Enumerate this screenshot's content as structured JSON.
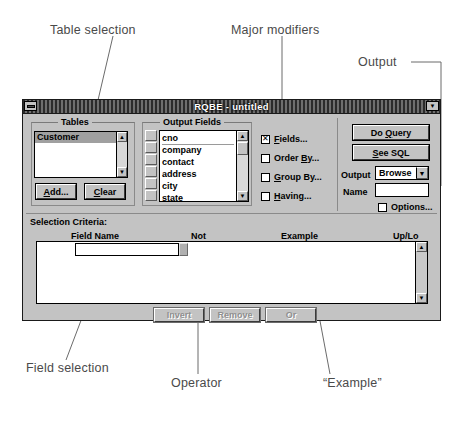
{
  "annotations": [
    {
      "id": "table-selection",
      "text": "Table selection",
      "x": 50,
      "y": 23
    },
    {
      "id": "major-modifiers",
      "text": "Major modifiers",
      "x": 231,
      "y": 23
    },
    {
      "id": "output",
      "text": "Output",
      "x": 358,
      "y": 62
    },
    {
      "id": "field-selection",
      "text": "Field selection",
      "x": 26,
      "y": 368
    },
    {
      "id": "operator",
      "text": "Operator",
      "x": 171,
      "y": 383
    },
    {
      "id": "example",
      "text": "“Example”",
      "x": 323,
      "y": 383
    }
  ],
  "window": {
    "title": "RQBE - untitled",
    "sysmenu_icon": "system-menu-icon",
    "minimize_icon": "restore-down-icon"
  },
  "tables": {
    "group_label": "Tables",
    "items": [
      {
        "label": "Customer",
        "selected": true
      }
    ],
    "add_label": "Add...",
    "add_accel": "A",
    "clear_label": "Clear",
    "clear_accel": "C",
    "scroll_up_icon": "scroll-up-arrow",
    "scroll_down_icon": "scroll-down-arrow"
  },
  "output_fields": {
    "group_label": "Output Fields",
    "items": [
      "cno",
      "company",
      "contact",
      "address",
      "city",
      "state"
    ],
    "move_handle_icon": "move-handle-icon",
    "scroll_up_icon": "scroll-up-arrow",
    "scroll_down_icon": "scroll-down-arrow"
  },
  "modifiers": [
    {
      "label": "Fields...",
      "accel": "F",
      "checked": true,
      "name": "fields"
    },
    {
      "label": "Order By...",
      "accel": "B",
      "checked": false,
      "name": "order-by"
    },
    {
      "label": "Group By...",
      "accel": "G",
      "checked": false,
      "name": "group-by"
    },
    {
      "label": "Having...",
      "accel": "H",
      "checked": false,
      "name": "having"
    }
  ],
  "output_panel": {
    "do_query_label": "Do Query",
    "do_query_accel": "Q",
    "see_sql_label": "See SQL",
    "see_sql_accel": "S",
    "output_label": "Output",
    "output_value": "Browse",
    "output_dropdown_icon": "dropdown-arrow-icon",
    "name_label": "Name",
    "name_value": "",
    "options_label": "Options...",
    "options_checked": false
  },
  "criteria": {
    "section_label": "Selection Criteria:",
    "columns": [
      "Field Name",
      "Not",
      "Example",
      "Up/Lo"
    ],
    "field_name_value": "",
    "field_picker_icon": "field-picker-button",
    "rows": [],
    "scroll_up_icon": "scroll-up-arrow",
    "scroll_down_icon": "scroll-down-arrow"
  },
  "criteria_buttons": [
    {
      "label": "Invert",
      "name": "invert-button",
      "disabled": true
    },
    {
      "label": "Remove",
      "name": "remove-button",
      "disabled": true
    },
    {
      "label": "Or",
      "name": "or-button",
      "disabled": true
    }
  ],
  "colors": {
    "window_face": "#c3c3c3",
    "titlebar": "#3a3a3a",
    "selection": "#a0a0a0",
    "field_bg": "#ffffff",
    "annotation_text": "#4a4a4a"
  }
}
